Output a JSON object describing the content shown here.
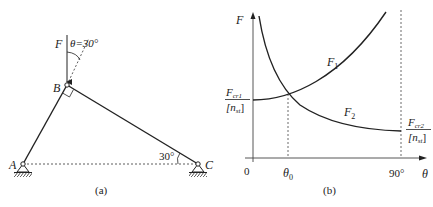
{
  "panel_a": {
    "caption": "(a)",
    "point_A": "A",
    "point_B": "B",
    "point_C": "C",
    "force_label": "F",
    "theta_label": "θ=30°",
    "angle_C_label": "30°"
  },
  "panel_b": {
    "caption": "(b)",
    "y_axis_label": "F",
    "x_axis_label": "θ",
    "origin_label": "0",
    "theta0_label": "θ",
    "theta0_sub": "0",
    "x90_label": "90°",
    "curve1_label": "F",
    "curve1_sub": "1",
    "curve2_label": "F",
    "curve2_sub": "2",
    "left_frac_num": "F",
    "left_frac_num_sub": "cr1",
    "left_frac_den": "[n",
    "left_frac_den_sub": "st",
    "left_frac_den_end": "]",
    "right_frac_num": "F",
    "right_frac_num_sub": "cr2",
    "right_frac_den": "[n",
    "right_frac_den_sub": "st",
    "right_frac_den_end": "]"
  },
  "colors": {
    "ink": "#222222",
    "background": "#ffffff"
  }
}
